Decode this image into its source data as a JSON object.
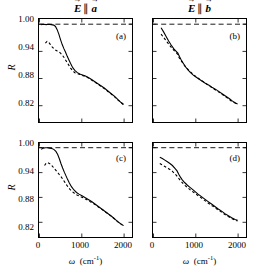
{
  "figure": {
    "column_titles": [
      {
        "id": "col-a",
        "field": "E",
        "relation": "∥",
        "axis": "a"
      },
      {
        "id": "col-b",
        "field": "E",
        "relation": "∥",
        "axis": "b"
      }
    ],
    "y_axis_label": "R",
    "x_axis_label_symbol": "ω",
    "x_axis_label_units": "(cm",
    "x_axis_label_units_exp": "-1",
    "x_axis_label_units_close": ")",
    "y_ticks": [
      "1.00",
      "0.94",
      "0.88",
      "0.82"
    ],
    "x_ticks": [
      "0",
      "1000",
      "2000"
    ],
    "panel_labels": [
      "(a)",
      "(b)",
      "(c)",
      "(d)"
    ],
    "line_color": "#000000",
    "reference_line_value": "1.00"
  },
  "chart_data": {
    "type": "line",
    "title": "",
    "xlabel": "ω (cm^-1)",
    "ylabel": "R",
    "xlim": [
      0,
      2200
    ],
    "ylim": [
      0.79,
      1.02
    ],
    "grid": false,
    "legend": null,
    "x_ticks": [
      0,
      1000,
      2000
    ],
    "y_ticks": [
      1.0,
      0.94,
      0.88,
      0.82
    ],
    "panels": [
      {
        "label": "(a)",
        "column_title": "E || a",
        "reference_line": {
          "y": 1.0,
          "style": "dashed"
        },
        "series": [
          {
            "name": "experiment",
            "style": "solid",
            "x": [
              40,
              100,
              160,
              220,
              280,
              340,
              380,
              420,
              460,
              500,
              540,
              580,
              620,
              660,
              700,
              740,
              790,
              840,
              900,
              960,
              1020,
              1080,
              1150,
              1220,
              1300,
              1380,
              1460,
              1540,
              1620,
              1700,
              1780,
              1860,
              1940,
              2000
            ],
            "y": [
              0.999,
              1.0,
              0.999,
              1.0,
              0.999,
              0.998,
              0.995,
              0.988,
              0.978,
              0.966,
              0.955,
              0.946,
              0.938,
              0.929,
              0.921,
              0.913,
              0.904,
              0.898,
              0.893,
              0.89,
              0.888,
              0.886,
              0.883,
              0.879,
              0.874,
              0.869,
              0.864,
              0.859,
              0.853,
              0.847,
              0.841,
              0.834,
              0.827,
              0.823
            ]
          },
          {
            "name": "model-fit",
            "style": "dashed",
            "x": [
              140,
              180,
              220,
              260,
              300,
              340,
              380,
              420,
              460,
              500,
              540,
              580,
              620,
              660,
              700,
              740,
              790,
              840,
              900,
              960,
              1020,
              1080,
              1150,
              1220,
              1300,
              1380,
              1460,
              1540,
              1620,
              1700,
              1780,
              1860,
              1940,
              2000
            ],
            "y": [
              0.958,
              0.962,
              0.96,
              0.955,
              0.95,
              0.946,
              0.943,
              0.941,
              0.939,
              0.936,
              0.932,
              0.927,
              0.921,
              0.915,
              0.909,
              0.903,
              0.897,
              0.893,
              0.891,
              0.889,
              0.887,
              0.885,
              0.882,
              0.878,
              0.873,
              0.868,
              0.863,
              0.858,
              0.852,
              0.846,
              0.84,
              0.833,
              0.827,
              0.822
            ]
          }
        ]
      },
      {
        "label": "(b)",
        "column_title": "E || b",
        "reference_line": {
          "y": 1.0,
          "style": "dashed"
        },
        "series": [
          {
            "name": "experiment",
            "style": "solid",
            "x": [
              180,
              240,
              300,
              360,
              420,
              480,
              540,
              580,
              620,
              660,
              700,
              760,
              820,
              880,
              940,
              1000,
              1080,
              1160,
              1240,
              1320,
              1400,
              1480,
              1560,
              1640,
              1720,
              1800,
              1880,
              1950,
              2000
            ],
            "y": [
              0.992,
              0.983,
              0.973,
              0.963,
              0.954,
              0.946,
              0.94,
              0.936,
              0.928,
              0.921,
              0.915,
              0.906,
              0.899,
              0.893,
              0.888,
              0.884,
              0.879,
              0.874,
              0.869,
              0.865,
              0.86,
              0.856,
              0.851,
              0.846,
              0.841,
              0.836,
              0.83,
              0.826,
              0.824
            ]
          },
          {
            "name": "model-fit",
            "style": "dashed",
            "x": [
              180,
              230,
              280,
              330,
              380,
              430,
              480,
              530,
              570,
              610,
              660,
              720,
              780,
              840,
              900,
              960,
              1040,
              1120,
              1200,
              1280,
              1360,
              1440,
              1520,
              1600,
              1680,
              1760,
              1840,
              1920,
              2000
            ],
            "y": [
              0.978,
              0.972,
              0.966,
              0.96,
              0.954,
              0.948,
              0.943,
              0.938,
              0.934,
              0.926,
              0.919,
              0.911,
              0.904,
              0.898,
              0.893,
              0.888,
              0.882,
              0.877,
              0.872,
              0.867,
              0.862,
              0.857,
              0.852,
              0.847,
              0.842,
              0.837,
              0.831,
              0.827,
              0.823
            ]
          }
        ]
      },
      {
        "label": "(c)",
        "column_title": "E || a",
        "reference_line": {
          "y": 1.0,
          "style": "dashed"
        },
        "series": [
          {
            "name": "experiment",
            "style": "solid",
            "x": [
              40,
              90,
              140,
              190,
              240,
              290,
              340,
              390,
              430,
              470,
              510,
              550,
              590,
              630,
              670,
              710,
              760,
              820,
              880,
              940,
              1010,
              1080,
              1160,
              1240,
              1320,
              1400,
              1480,
              1560,
              1640,
              1720,
              1800,
              1880,
              1950,
              2000
            ],
            "y": [
              0.996,
              0.999,
              1.0,
              1.0,
              0.999,
              0.998,
              0.996,
              0.991,
              0.984,
              0.974,
              0.962,
              0.951,
              0.941,
              0.932,
              0.923,
              0.915,
              0.906,
              0.898,
              0.892,
              0.888,
              0.884,
              0.88,
              0.875,
              0.87,
              0.864,
              0.858,
              0.852,
              0.846,
              0.84,
              0.834,
              0.827,
              0.82,
              0.815,
              0.812
            ]
          },
          {
            "name": "model-fit",
            "style": "dashed",
            "x": [
              120,
              160,
              200,
              250,
              300,
              350,
              400,
              440,
              480,
              520,
              560,
              600,
              640,
              680,
              720,
              770,
              830,
              890,
              950,
              1020,
              1090,
              1170,
              1250,
              1330,
              1410,
              1490,
              1570,
              1650,
              1730,
              1810,
              1890,
              1950,
              2000
            ],
            "y": [
              0.957,
              0.963,
              0.964,
              0.961,
              0.956,
              0.95,
              0.944,
              0.939,
              0.934,
              0.929,
              0.923,
              0.917,
              0.911,
              0.905,
              0.9,
              0.895,
              0.89,
              0.886,
              0.883,
              0.88,
              0.876,
              0.872,
              0.867,
              0.862,
              0.856,
              0.851,
              0.845,
              0.839,
              0.833,
              0.826,
              0.819,
              0.815,
              0.811
            ]
          }
        ]
      },
      {
        "label": "(d)",
        "column_title": "E || b",
        "reference_line": {
          "y": 1.0,
          "style": "dashed"
        },
        "series": [
          {
            "name": "experiment",
            "style": "solid",
            "x": [
              150,
              210,
              270,
              330,
              390,
              450,
              510,
              560,
              600,
              640,
              680,
              740,
              800,
              860,
              920,
              990,
              1060,
              1140,
              1220,
              1300,
              1380,
              1460,
              1540,
              1620,
              1700,
              1780,
              1860,
              1940,
              2000
            ],
            "y": [
              0.977,
              0.974,
              0.97,
              0.966,
              0.962,
              0.957,
              0.95,
              0.944,
              0.936,
              0.929,
              0.923,
              0.916,
              0.91,
              0.905,
              0.9,
              0.894,
              0.888,
              0.882,
              0.876,
              0.87,
              0.864,
              0.858,
              0.852,
              0.847,
              0.841,
              0.836,
              0.831,
              0.827,
              0.825
            ]
          },
          {
            "name": "model-fit",
            "style": "dashed",
            "x": [
              150,
              200,
              250,
              300,
              350,
              400,
              450,
              500,
              545,
              590,
              640,
              700,
              760,
              820,
              890,
              960,
              1040,
              1120,
              1200,
              1280,
              1360,
              1440,
              1520,
              1600,
              1680,
              1760,
              1840,
              1920,
              2000
            ],
            "y": [
              0.962,
              0.959,
              0.956,
              0.953,
              0.95,
              0.947,
              0.943,
              0.938,
              0.933,
              0.927,
              0.921,
              0.914,
              0.908,
              0.903,
              0.897,
              0.892,
              0.886,
              0.88,
              0.874,
              0.868,
              0.862,
              0.857,
              0.851,
              0.846,
              0.84,
              0.835,
              0.83,
              0.826,
              0.823
            ]
          }
        ]
      }
    ]
  }
}
